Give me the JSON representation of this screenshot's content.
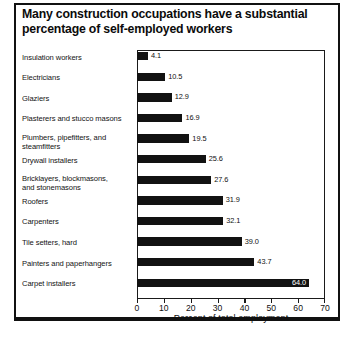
{
  "chart_data": {
    "type": "bar",
    "orientation": "horizontal",
    "title": "Many construction occupations have a substantial percentage of self-employed workers",
    "title_lines": [
      "Many construction occupations have a substantial",
      "percentage of self-employed workers"
    ],
    "xlabel": "Percent of total employment",
    "ylabel": "",
    "xlim": [
      0,
      70
    ],
    "xticks": [
      0,
      10,
      20,
      30,
      40,
      50,
      60,
      70
    ],
    "xtick_labels": [
      "0",
      "10",
      "20",
      "30",
      "40",
      "50",
      "60",
      "70"
    ],
    "grid": false,
    "legend": null,
    "bar_color": "#121212",
    "categories": [
      "Insulation workers",
      "Electricians",
      "Glaziers",
      "Plasterers and stucco masons",
      "Plumbers, pipefitters, and steamfitters",
      "Drywall installers",
      "Bricklayers, blockmasons, and stonemasons",
      "Roofers",
      "Carpenters",
      "Tile setters, hard",
      "Painters and paperhangers",
      "Carpet installers"
    ],
    "category_lines": [
      [
        "Insulation workers"
      ],
      [
        "Electricians"
      ],
      [
        "Glaziers"
      ],
      [
        "Plasterers and stucco masons"
      ],
      [
        "Plumbers, pipefitters, and",
        "steamfitters"
      ],
      [
        "Drywall installers"
      ],
      [
        "Bricklayers, blockmasons,",
        "and stonemasons"
      ],
      [
        "Roofers"
      ],
      [
        "Carpenters"
      ],
      [
        "Tile setters, hard"
      ],
      [
        "Painters and paperhangers"
      ],
      [
        "Carpet installers"
      ]
    ],
    "values": [
      4.1,
      10.5,
      12.9,
      16.9,
      19.5,
      25.6,
      27.6,
      31.9,
      32.1,
      39.0,
      43.7,
      64.0
    ],
    "value_labels": [
      "4.1",
      "10.5",
      "12.9",
      "16.9",
      "19.5",
      "25.6",
      "27.6",
      "31.9",
      "32.1",
      "39.0",
      "43.7",
      "64.0"
    ],
    "value_label_position": [
      "outside",
      "outside",
      "outside",
      "outside",
      "outside",
      "outside",
      "outside",
      "outside",
      "outside",
      "outside",
      "outside",
      "inside"
    ]
  }
}
